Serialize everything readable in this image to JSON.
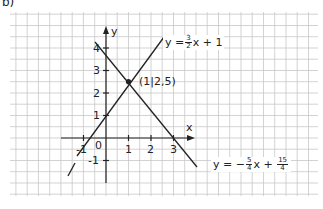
{
  "part_label": "b)",
  "axes": {
    "x_label": "x",
    "y_label": "y",
    "origin_label": "0",
    "x_ticks": [
      "-1",
      "1",
      "2",
      "3"
    ],
    "y_ticks": [
      "4",
      "3",
      "2",
      "1",
      "-1"
    ]
  },
  "lines": [
    {
      "name": "rising-line",
      "equation_prefix": "y = ",
      "frac_num": "3",
      "frac_den": "2",
      "equation_suffix": "x + 1",
      "slope": 1.5,
      "intercept": 1
    },
    {
      "name": "falling-line",
      "equation_prefix": "y = −",
      "frac_num": "5",
      "frac_den": "4",
      "equation_mid": "x + ",
      "frac2_num": "15",
      "frac2_den": "4",
      "slope": -1.25,
      "intercept": 3.75
    }
  ],
  "intersection": {
    "label": "(1|2,5)",
    "x": 1,
    "y": 2.5
  },
  "colors": {
    "grid": "#c8c8c8",
    "ink": "#222222",
    "background": "#ffffff"
  }
}
